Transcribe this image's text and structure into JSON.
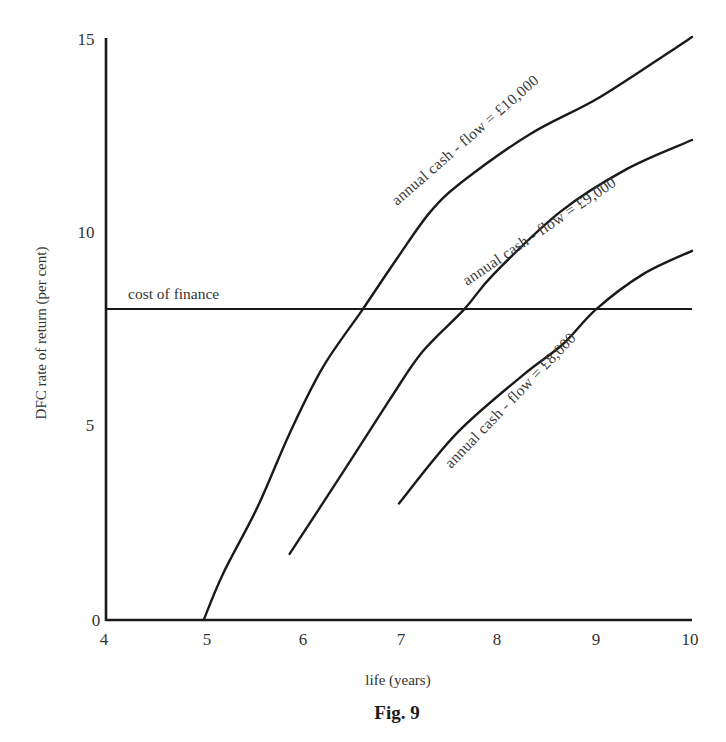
{
  "figure": {
    "caption": "Fig. 9"
  },
  "chart_data": {
    "type": "line",
    "title": "",
    "caption": "Fig. 9",
    "xlabel": "life (years)",
    "ylabel": "DFC rate of return (per cent)",
    "xlim": [
      4,
      10
    ],
    "ylim": [
      0,
      15
    ],
    "xticks": [
      4,
      5,
      6,
      7,
      8,
      9,
      10
    ],
    "yticks": [
      0,
      5,
      10,
      15
    ],
    "xtick_labels": [
      "4",
      "5",
      "6",
      "7",
      "8",
      "9",
      "10"
    ],
    "ytick_labels": [
      "0",
      "5",
      "10",
      "15"
    ],
    "grid": false,
    "legend": "none (curves labelled inline)",
    "reference_lines": [
      {
        "name": "cost of finance",
        "orientation": "horizontal",
        "y": 8.0,
        "label": "cost of finance"
      }
    ],
    "series": [
      {
        "name": "annual cash-flow = £10,000",
        "label": "annual cash - flow = £10,000",
        "x": [
          5.0,
          5.2,
          5.55,
          5.88,
          6.22,
          6.63,
          6.98,
          7.32,
          7.66,
          8.34,
          9.02,
          9.7,
          10.0
        ],
        "y": [
          0.0,
          1.2,
          2.9,
          4.8,
          6.5,
          8.0,
          9.3,
          10.5,
          11.3,
          12.5,
          13.4,
          14.5,
          15.0
        ]
      },
      {
        "name": "annual cash-flow = £9,000",
        "label": "annual cash - flow = £9,000",
        "x": [
          5.88,
          6.4,
          6.9,
          7.24,
          7.67,
          7.97,
          8.65,
          9.33,
          10.0
        ],
        "y": [
          1.7,
          3.7,
          5.65,
          6.9,
          8.0,
          8.9,
          10.5,
          11.6,
          12.35
        ]
      },
      {
        "name": "annual cash-flow = £8,000",
        "label": "annual cash - flow = £8,000",
        "x": [
          7.0,
          7.59,
          8.27,
          8.68,
          9.02,
          9.5,
          10.0
        ],
        "y": [
          3.0,
          4.8,
          6.3,
          7.1,
          8.0,
          8.9,
          9.5
        ]
      }
    ]
  }
}
